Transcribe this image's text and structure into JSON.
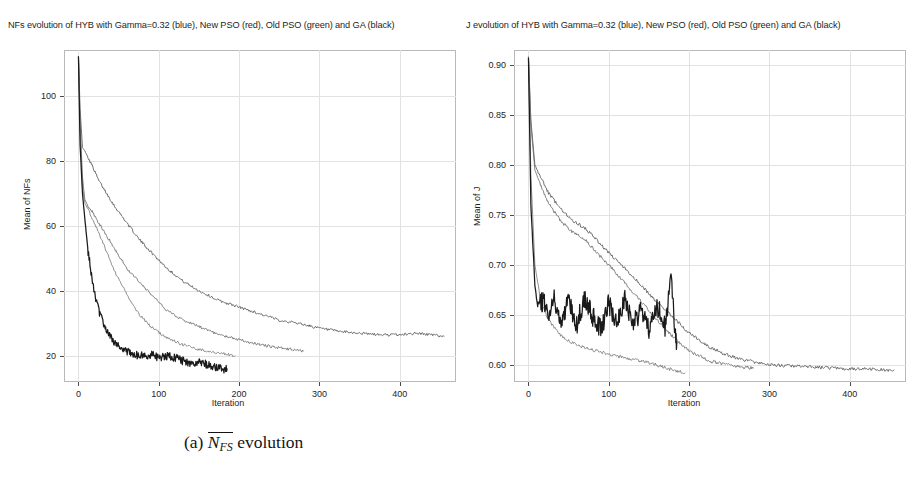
{
  "figure": {
    "caption_a": "(a)",
    "caption_a_symbol": "N",
    "caption_a_subscript": "FS",
    "caption_a_text": "evolution",
    "caption_b": "(b)",
    "caption_b_symbol": "J",
    "caption_b_text": "evolution"
  },
  "panel_a": {
    "title": "NFs evolution of HYB with Gamma=0.32 (blue), New PSO (red), Old PSO (green) and GA (black)",
    "xlabel": "Iteration",
    "ylabel": "Mean of NFs"
  },
  "panel_b": {
    "title": "J evolution of HYB with Gamma=0.32 (blue), New PSO (red), Old PSO (green) and GA (black)",
    "xlabel": "Iteration",
    "ylabel": "Mean of J"
  },
  "colors": {
    "blue": "#5a5a5a",
    "red": "#6e6e6e",
    "green": "#7b7b7b",
    "black": "#1a1a1a",
    "grid": "#e2e2e2",
    "frame": "#b9b9b9",
    "background": "#ffffff"
  },
  "chart_data": [
    {
      "type": "line",
      "panel": "a",
      "title": "NFs evolution of HYB with Gamma=0.32 (blue), New PSO (red), Old PSO (green) and GA (black)",
      "xlabel": "Iteration",
      "ylabel": "Mean of NFs",
      "xlim": [
        -18,
        470
      ],
      "ylim": [
        12,
        114
      ],
      "xticks": [
        0,
        100,
        200,
        300,
        400
      ],
      "yticks": [
        20,
        40,
        60,
        80,
        100
      ],
      "grid": true,
      "legend": "none",
      "series": [
        {
          "name": "HYB with Gamma=0.32 (blue)",
          "color": "#5a5a5a",
          "x": [
            0,
            2,
            5,
            8,
            12,
            18,
            25,
            35,
            45,
            60,
            75,
            90,
            110,
            130,
            150,
            175,
            200,
            225,
            250,
            275,
            300,
            325,
            350,
            375,
            400,
            420,
            440,
            455
          ],
          "values": [
            112,
            96,
            84,
            83,
            81,
            78,
            74,
            70,
            66,
            61,
            56,
            52,
            47,
            43,
            40,
            37,
            35,
            33,
            31,
            30,
            28.5,
            27.5,
            27,
            26.5,
            26.5,
            27,
            26.5,
            26
          ]
        },
        {
          "name": "New PSO (red)",
          "color": "#6e6e6e",
          "x": [
            0,
            2,
            5,
            8,
            12,
            18,
            25,
            35,
            45,
            60,
            75,
            90,
            110,
            130,
            150,
            175,
            200,
            225,
            250,
            265,
            280
          ],
          "values": [
            112,
            92,
            75,
            68,
            66,
            64,
            61,
            57,
            53,
            47,
            43,
            39,
            34,
            31,
            29,
            26.5,
            25,
            23.5,
            22.5,
            22,
            21.5
          ]
        },
        {
          "name": "Old PSO (green)",
          "color": "#7b7b7b",
          "x": [
            0,
            2,
            5,
            8,
            12,
            18,
            25,
            35,
            45,
            60,
            75,
            90,
            110,
            130,
            150,
            170,
            185,
            195
          ],
          "values": [
            112,
            90,
            72,
            67,
            65,
            62,
            58,
            52,
            46,
            39,
            33,
            29,
            25.5,
            23.5,
            22,
            21,
            20.5,
            20
          ]
        },
        {
          "name": "GA (black)",
          "color": "#1a1a1a",
          "x": [
            0,
            2,
            5,
            8,
            12,
            18,
            25,
            32,
            40,
            50,
            60,
            70,
            80,
            90,
            100,
            110,
            120,
            130,
            140,
            150,
            160,
            170,
            180,
            185
          ],
          "values": [
            112,
            85,
            70,
            62,
            52,
            42,
            34,
            29,
            25.5,
            23,
            21.5,
            20.5,
            20,
            20.5,
            19.5,
            20,
            19.5,
            18.5,
            17.5,
            18,
            17.5,
            16.5,
            16,
            16
          ]
        }
      ]
    },
    {
      "type": "line",
      "panel": "b",
      "title": "J evolution of HYB with Gamma=0.32 (blue), New PSO (red), Old PSO (green) and GA (black)",
      "xlabel": "Iteration",
      "ylabel": "Mean of J",
      "xlim": [
        -18,
        470
      ],
      "ylim": [
        0.583,
        0.915
      ],
      "xticks": [
        0,
        100,
        200,
        300,
        400
      ],
      "yticks": [
        0.6,
        0.65,
        0.7,
        0.75,
        0.8,
        0.85,
        0.9
      ],
      "grid": true,
      "legend": "none",
      "series": [
        {
          "name": "HYB with Gamma=0.32 (blue)",
          "color": "#5a5a5a",
          "x": [
            0,
            3,
            8,
            15,
            25,
            40,
            55,
            70,
            85,
            100,
            120,
            140,
            160,
            180,
            200,
            225,
            250,
            275,
            300,
            325,
            350,
            375,
            400,
            425,
            450,
            455
          ],
          "values": [
            0.908,
            0.845,
            0.8,
            0.788,
            0.772,
            0.756,
            0.744,
            0.737,
            0.725,
            0.712,
            0.697,
            0.68,
            0.663,
            0.648,
            0.632,
            0.618,
            0.609,
            0.604,
            0.6,
            0.599,
            0.598,
            0.597,
            0.596,
            0.596,
            0.595,
            0.595
          ]
        },
        {
          "name": "New PSO (red)",
          "color": "#6e6e6e",
          "x": [
            0,
            3,
            8,
            15,
            25,
            40,
            55,
            70,
            85,
            100,
            120,
            140,
            160,
            180,
            200,
            225,
            250,
            265,
            280
          ],
          "values": [
            0.908,
            0.84,
            0.795,
            0.78,
            0.762,
            0.744,
            0.733,
            0.726,
            0.712,
            0.7,
            0.682,
            0.664,
            0.645,
            0.628,
            0.614,
            0.604,
            0.6,
            0.598,
            0.597
          ]
        },
        {
          "name": "Old PSO (green)",
          "color": "#7b7b7b",
          "x": [
            0,
            3,
            8,
            15,
            25,
            40,
            55,
            70,
            85,
            100,
            120,
            140,
            160,
            180,
            195
          ],
          "values": [
            0.908,
            0.79,
            0.7,
            0.665,
            0.645,
            0.63,
            0.622,
            0.617,
            0.614,
            0.611,
            0.607,
            0.604,
            0.6,
            0.595,
            0.592
          ]
        },
        {
          "name": "GA (black)",
          "color": "#1a1a1a",
          "x": [
            0,
            3,
            8,
            12,
            18,
            25,
            32,
            40,
            50,
            60,
            70,
            80,
            90,
            100,
            110,
            120,
            130,
            140,
            150,
            160,
            170,
            178,
            183,
            185
          ],
          "values": [
            0.908,
            0.76,
            0.68,
            0.655,
            0.665,
            0.65,
            0.668,
            0.645,
            0.662,
            0.64,
            0.668,
            0.648,
            0.635,
            0.662,
            0.642,
            0.668,
            0.64,
            0.655,
            0.634,
            0.66,
            0.638,
            0.69,
            0.628,
            0.622
          ]
        }
      ]
    }
  ]
}
